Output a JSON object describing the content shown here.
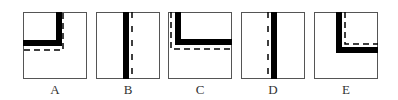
{
  "figure": {
    "panels": [
      {
        "id": "A",
        "label": "A",
        "left": 23,
        "shape": "corner-top-left",
        "description": "Solid black L corner in upper-left; dashed L outline offset right/below"
      },
      {
        "id": "B",
        "label": "B",
        "left": 96,
        "shape": "vertical",
        "description": "Solid black vertical bar; dashed vertical line to its right"
      },
      {
        "id": "C",
        "label": "C",
        "left": 168,
        "shape": "corner-top-right",
        "description": "Solid black L corner in upper-right; dashed L outline offset left/below"
      },
      {
        "id": "D",
        "label": "D",
        "left": 241,
        "shape": "vertical-left-dash",
        "description": "Solid black vertical bar; dashed vertical line to its left"
      },
      {
        "id": "E",
        "label": "E",
        "left": 314,
        "shape": "corner-top-right-inner",
        "description": "Solid black L corner; dashed L outline inside above/right"
      }
    ],
    "colors": {
      "stroke": "#555555",
      "solid": "#000000",
      "background": "#ffffff"
    }
  }
}
